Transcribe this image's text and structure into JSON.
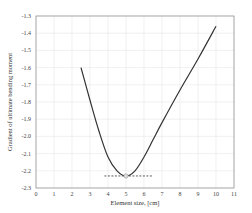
{
  "chart_data": {
    "type": "line",
    "title": "",
    "xlabel": "Element size, [cm]",
    "ylabel": "Gradient of ultimate bending moment",
    "xlim": [
      0,
      11
    ],
    "ylim": [
      -2.3,
      -1.3
    ],
    "xticks": [
      "0",
      "1",
      "2",
      "3",
      "4",
      "5",
      "6",
      "7",
      "8",
      "9",
      "10",
      "11"
    ],
    "yticks": [
      "-1.3",
      "-1.4",
      "-1.5",
      "-1.6",
      "-1.7",
      "-1.8",
      "-1.9",
      "-2.0",
      "-2.1",
      "-2.2",
      "-2.3"
    ],
    "grid": true,
    "legend": null,
    "series": [
      {
        "name": "gradient",
        "color": "#333333",
        "x": [
          2.5,
          3.0,
          3.5,
          4.0,
          4.5,
          5.0,
          5.5,
          6.0,
          6.5,
          7.0,
          8.0,
          9.0,
          10.0
        ],
        "y": [
          -1.6,
          -1.79,
          -1.97,
          -2.12,
          -2.2,
          -2.23,
          -2.2,
          -2.12,
          -2.02,
          -1.92,
          -1.73,
          -1.55,
          -1.36
        ]
      }
    ],
    "annotations": [
      {
        "type": "hline-dashed",
        "y": -2.23,
        "x_from": 3.8,
        "x_to": 6.5,
        "color": "#333333"
      },
      {
        "type": "marker",
        "x": 5.0,
        "y": -2.23,
        "color": "#cccccc"
      }
    ]
  }
}
